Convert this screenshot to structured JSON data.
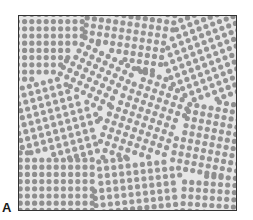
{
  "figure": {
    "panel_label": "A",
    "colors": {
      "particle": "#8c8c8c",
      "background": "#e6e6e6",
      "frame": "#333333"
    }
  }
}
